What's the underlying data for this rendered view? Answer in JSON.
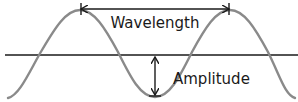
{
  "diagram": {
    "type": "transverse-wave",
    "labels": {
      "wavelength": "Wavelength",
      "amplitude": "Amplitude"
    },
    "colors": {
      "wave": "#8a8a8a",
      "axis": "#1a1a1a",
      "arrows": "#1a1a1a",
      "text": "#1a1a1a",
      "background": "#ffffff"
    },
    "annotations": [
      {
        "name": "wavelength",
        "kind": "horizontal-double-arrow",
        "from": "crest-1",
        "to": "crest-2"
      },
      {
        "name": "amplitude",
        "kind": "vertical-double-arrow",
        "from": "equilibrium-line",
        "to": "trough"
      }
    ]
  }
}
